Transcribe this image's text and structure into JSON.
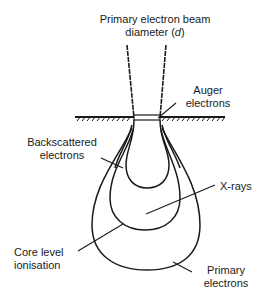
{
  "diagram": {
    "title_line1": "Primary electron beam",
    "title_line2_prefix": "diameter (",
    "title_line2_var": "d",
    "title_line2_suffix": ")",
    "labels": {
      "auger_line1": "Auger",
      "auger_line2": "electrons",
      "backscattered_line1": "Backscattered",
      "backscattered_line2": "electrons",
      "xrays": "X-rays",
      "core_line1": "Core level",
      "core_line2": "ionisation",
      "primary_line1": "Primary",
      "primary_line2": "electrons"
    },
    "colors": {
      "stroke": "#1a1a1a",
      "background": "#ffffff"
    }
  }
}
